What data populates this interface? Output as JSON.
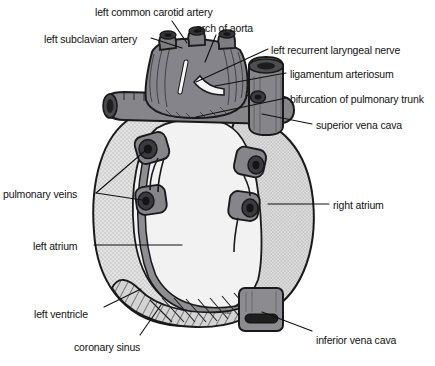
{
  "figure": {
    "signature": "vac"
  },
  "palette": {
    "outline": "#1a1a1a",
    "vessel_gray": "#86868a",
    "vessel_gray_dark": "#6d6d72",
    "vessel_gray_light": "#9b9ba0",
    "atrium_light": "#f0f0f0",
    "atrium_stipple": "#d6d6d6",
    "ventricle_fill": "#d2d2d2",
    "coronary_sinus": "#8e8e92",
    "lumen_dark": "#262626",
    "background": "#ffffff",
    "label_text": "#111111",
    "leader_line": "#111111"
  },
  "labels": [
    {
      "id": "left-common-carotid-artery",
      "text": "left common carotid artery",
      "x": 95,
      "y": 6,
      "anchor": "start"
    },
    {
      "id": "arch-of-aorta",
      "text": "arch of aorta",
      "x": 196,
      "y": 22,
      "anchor": "start"
    },
    {
      "id": "left-subclavian-artery",
      "text": "left subclavian artery",
      "x": 44,
      "y": 33,
      "anchor": "start"
    },
    {
      "id": "left-recurrent-laryngeal-nerve",
      "text": "left recurrent laryngeal nerve",
      "x": 271,
      "y": 44,
      "anchor": "start"
    },
    {
      "id": "ligamentum-arteriosum",
      "text": "ligamentum arteriosum",
      "x": 290,
      "y": 68,
      "anchor": "start"
    },
    {
      "id": "bifurcation-of-pulmonary-trunk",
      "text": "bifurcation of pulmonary trunk",
      "x": 290,
      "y": 93,
      "anchor": "start"
    },
    {
      "id": "superior-vena-cava",
      "text": "superior vena cava",
      "x": 316,
      "y": 119,
      "anchor": "start"
    },
    {
      "id": "pulmonary-veins",
      "text": "pulmonary veins",
      "x": 3,
      "y": 188,
      "anchor": "start"
    },
    {
      "id": "right-atrium",
      "text": "right atrium",
      "x": 333,
      "y": 199,
      "anchor": "start"
    },
    {
      "id": "left-atrium",
      "text": "left atrium",
      "x": 33,
      "y": 240,
      "anchor": "start"
    },
    {
      "id": "left-ventricle",
      "text": "left ventricle",
      "x": 34,
      "y": 308,
      "anchor": "start"
    },
    {
      "id": "coronary-sinus",
      "text": "coronary sinus",
      "x": 74,
      "y": 341,
      "anchor": "start"
    },
    {
      "id": "inferior-vena-cava",
      "text": "inferior vena cava",
      "x": 316,
      "y": 334,
      "anchor": "start"
    }
  ],
  "leader_lines": [
    {
      "id": "leader-left-common-carotid-artery",
      "points": "172,21 187,43"
    },
    {
      "id": "leader-arch-of-aorta",
      "points": "216,35 205,62"
    },
    {
      "id": "leader-left-subclavian-artery",
      "points": "151,38 182,48"
    },
    {
      "id": "leader-left-recurrent-laryngeal-nerve",
      "points": "268,49 196,82"
    },
    {
      "id": "leader-ligamentum-arteriosum",
      "points": "286,73 215,86"
    },
    {
      "id": "leader-bifurcation-of-pulmonary-trunk",
      "points": "286,98 196,117"
    },
    {
      "id": "leader-superior-vena-cava",
      "points": "312,124 262,114"
    },
    {
      "id": "leader-pulmonary-veins-upper",
      "points": "96,193 146,150"
    },
    {
      "id": "leader-pulmonary-veins-lower",
      "points": "96,193 142,200"
    },
    {
      "id": "leader-right-atrium",
      "points": "329,204 268,204"
    },
    {
      "id": "leader-left-atrium",
      "points": "94,245 182,245"
    },
    {
      "id": "leader-left-ventricle",
      "points": "104,307 141,289"
    },
    {
      "id": "leader-coronary-sinus",
      "points": "140,335 161,305"
    },
    {
      "id": "leader-inferior-vena-cava",
      "points": "312,331 262,312"
    }
  ],
  "structures": [
    {
      "id": "aortic-arch",
      "name": "arch of aorta"
    },
    {
      "id": "brachiocephalic-stump",
      "name": "brachiocephalic trunk stump"
    },
    {
      "id": "left-common-carotid-stump",
      "name": "left common carotid stump"
    },
    {
      "id": "left-subclavian-stump",
      "name": "left subclavian stump"
    },
    {
      "id": "ligamentum-arteriosum-band",
      "name": "ligamentum arteriosum"
    },
    {
      "id": "recurrent-laryngeal-nerve-strand",
      "name": "left recurrent laryngeal nerve"
    },
    {
      "id": "pulmonary-trunk",
      "name": "pulmonary trunk"
    },
    {
      "id": "right-pulmonary-artery",
      "name": "right pulmonary artery"
    },
    {
      "id": "left-pulmonary-artery",
      "name": "left pulmonary artery"
    },
    {
      "id": "superior-vena-cava-vessel",
      "name": "superior vena cava"
    },
    {
      "id": "inferior-vena-cava-vessel",
      "name": "inferior vena cava"
    },
    {
      "id": "right-atrium-body",
      "name": "right atrium"
    },
    {
      "id": "left-atrium-body",
      "name": "left atrium"
    },
    {
      "id": "left-ventricle-body",
      "name": "left ventricle"
    },
    {
      "id": "coronary-sinus-band",
      "name": "coronary sinus"
    },
    {
      "id": "pulmonary-vein-stump-1",
      "name": "left superior pulmonary vein"
    },
    {
      "id": "pulmonary-vein-stump-2",
      "name": "left inferior pulmonary vein"
    },
    {
      "id": "pulmonary-vein-stump-3",
      "name": "right superior pulmonary vein"
    },
    {
      "id": "pulmonary-vein-stump-4",
      "name": "right inferior pulmonary vein"
    }
  ]
}
